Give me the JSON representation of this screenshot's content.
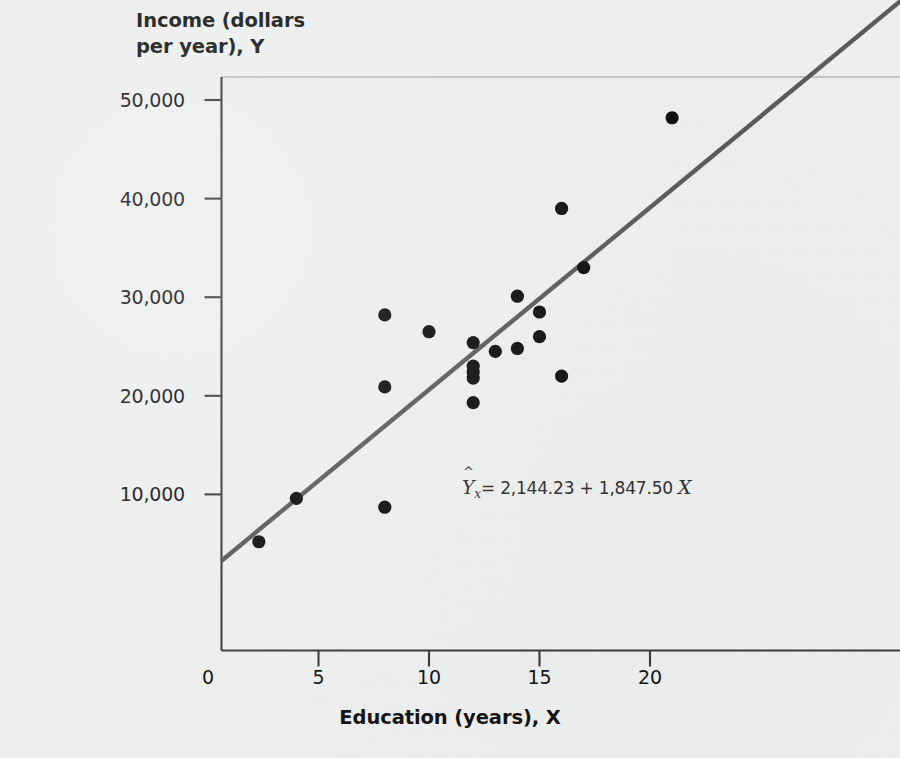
{
  "figure": {
    "background_color": "#edeeee",
    "axis_color": "#3a3a3a",
    "point_color": "#0d0d0d",
    "line_color": "#5a5a5a",
    "text_color": "#141414"
  },
  "y_axis": {
    "title": "Income (dollars\nper year), Y",
    "title_line1": "Income (dollars",
    "title_line2": "per year), Y",
    "ticks": [
      "50,000",
      "40,000",
      "30,000",
      "20,000",
      "10,000"
    ]
  },
  "x_axis": {
    "title": "Education (years), X",
    "ticks": [
      "0",
      "5",
      "10",
      "15",
      "20"
    ]
  },
  "annotation": {
    "equation_full": "Ŷx = 2,144.23 + 1,847.50 X",
    "y_symbol": "Y",
    "hat_symbol": "^",
    "subscript": "x",
    "equals": "=",
    "intercept": "2,144.23",
    "plus": "+",
    "slope": "1,847.50",
    "x_symbol": "X"
  },
  "chart_data": {
    "type": "scatter",
    "title": "",
    "xlabel": "Education (years), X",
    "ylabel": "Income (dollars per year), Y",
    "xlim": [
      -0.65,
      31.5
    ],
    "ylim": [
      -2600,
      58000
    ],
    "xticks": [
      0,
      5,
      10,
      15,
      20
    ],
    "yticks": [
      10000,
      20000,
      30000,
      40000,
      50000
    ],
    "grid": false,
    "legend": null,
    "points": [
      {
        "x": 2.3,
        "y": 5200
      },
      {
        "x": 4.0,
        "y": 9600
      },
      {
        "x": 8.0,
        "y": 8700
      },
      {
        "x": 8.0,
        "y": 20900
      },
      {
        "x": 8.0,
        "y": 28200
      },
      {
        "x": 10.0,
        "y": 26500
      },
      {
        "x": 12.0,
        "y": 19300
      },
      {
        "x": 12.0,
        "y": 21800
      },
      {
        "x": 12.0,
        "y": 22400
      },
      {
        "x": 12.0,
        "y": 23000
      },
      {
        "x": 12.0,
        "y": 25400
      },
      {
        "x": 13.0,
        "y": 24500
      },
      {
        "x": 14.0,
        "y": 24800
      },
      {
        "x": 14.0,
        "y": 30100
      },
      {
        "x": 15.0,
        "y": 26000
      },
      {
        "x": 15.0,
        "y": 28500
      },
      {
        "x": 16.0,
        "y": 22000
      },
      {
        "x": 16.0,
        "y": 39000
      },
      {
        "x": 17.0,
        "y": 33000
      },
      {
        "x": 21.0,
        "y": 48200
      }
    ],
    "regression_line": {
      "equation": "Ŷx = 2,144.23 + 1,847.50 X",
      "intercept": 2144.23,
      "slope": 1847.5,
      "x_start": 0.6,
      "x_end": 31.5
    }
  }
}
